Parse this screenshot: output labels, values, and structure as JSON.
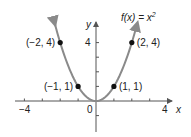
{
  "chart_data": {
    "type": "line",
    "title_parts": {
      "lhs": "f(x) = x",
      "exp": "2"
    },
    "xlabel": "x",
    "ylabel": "y",
    "xlim": [
      -4,
      4
    ],
    "ylim": [
      -1.5,
      5.5
    ],
    "x_tick_labels": [
      "−4",
      "0",
      "4"
    ],
    "y_tick_labels": [
      "4"
    ],
    "x_ticks": [
      -4,
      -3,
      -2,
      -1,
      1,
      2,
      3,
      4
    ],
    "y_ticks": [
      -1,
      1,
      2,
      3,
      4
    ],
    "series": [
      {
        "name": "f(x) = x^2",
        "function": "x^2",
        "domain": [
          -2.3,
          2.3
        ],
        "color": "#8a8a8a"
      }
    ],
    "points": [
      {
        "x": -2,
        "y": 4,
        "label": "(−2, 4)"
      },
      {
        "x": -1,
        "y": 1,
        "label": "(−1, 1)"
      },
      {
        "x": 1,
        "y": 1,
        "label": "(1, 1)"
      },
      {
        "x": 2,
        "y": 4,
        "label": "(2, 4)"
      }
    ],
    "grid": false
  },
  "colors": {
    "curve": "#8a8a8a",
    "axis": "#555555",
    "point": "#111111",
    "text": "#222222"
  }
}
